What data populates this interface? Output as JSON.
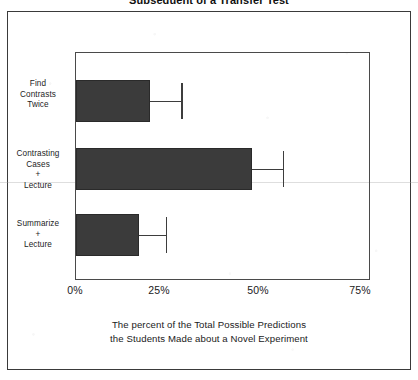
{
  "figure": {
    "title": "Subsequent of a Transfer Test",
    "caption_line1": "The percent of the Total Possible Predictions",
    "caption_line2": "the Students Made about a Novel Experiment"
  },
  "chart_data": {
    "type": "bar",
    "orientation": "horizontal",
    "title": "Subsequent of a Transfer Test",
    "xlabel": "The percent of the Total Possible Predictions the Students Made about a Novel Experiment",
    "ylabel": "",
    "xlim": [
      0,
      75
    ],
    "xticks": [
      0,
      25,
      50,
      75
    ],
    "xtick_labels": [
      "0%",
      "25%",
      "50%",
      "75%"
    ],
    "grid": false,
    "legend": false,
    "bar_color": "#3b3b3b",
    "categories": [
      "Find\nContrasts\nTwice",
      "Contrasting\nCases\n+\nLecture",
      "Summarize\n+\nLecture"
    ],
    "category_labels": [
      [
        "Find",
        "Contrasts",
        "Twice"
      ],
      [
        "Contrasting",
        "Cases",
        "+",
        "Lecture"
      ],
      [
        "Summarize",
        "+",
        "Lecture"
      ]
    ],
    "values": [
      19,
      45,
      16
    ],
    "errors": [
      8,
      8,
      7
    ],
    "error_upper": [
      27,
      53,
      23
    ],
    "units": "percent"
  }
}
